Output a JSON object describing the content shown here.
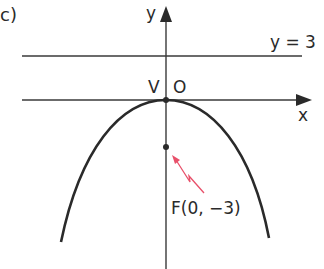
{
  "figure": {
    "part_label": "c)",
    "axis_x_label": "x",
    "axis_y_label": "y",
    "vertex_label": "V",
    "origin_label": "O",
    "directrix_label": "y = 3",
    "focus_label": "F(0, −3)"
  },
  "colors": {
    "line": "#2a2a2a",
    "arrow": "#e8506a"
  }
}
